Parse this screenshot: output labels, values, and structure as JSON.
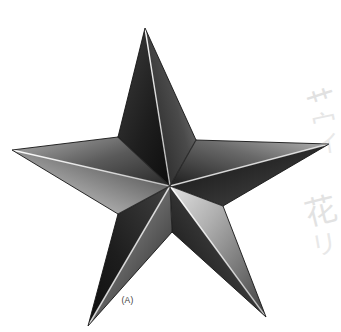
{
  "figure": {
    "caption": "(A)",
    "background_color": "#ffffff",
    "center": {
      "x": 170,
      "y": 186
    },
    "outer_points": [
      {
        "name": "top",
        "x": 145,
        "y": 28
      },
      {
        "name": "right",
        "x": 329,
        "y": 144
      },
      {
        "name": "bottom-right",
        "x": 266,
        "y": 317
      },
      {
        "name": "bottom-left",
        "x": 88,
        "y": 326
      },
      {
        "name": "left",
        "x": 12,
        "y": 150
      }
    ],
    "inner_points": [
      {
        "name": "upper-right",
        "x": 196,
        "y": 140
      },
      {
        "name": "lower-right",
        "x": 223,
        "y": 206
      },
      {
        "name": "lower",
        "x": 172,
        "y": 232
      },
      {
        "name": "lower-left",
        "x": 118,
        "y": 214
      },
      {
        "name": "upper-left",
        "x": 118,
        "y": 137
      }
    ],
    "palette": {
      "darkest": "#1a1a1a",
      "dark": "#3b3b3b",
      "mid_dark": "#5e5e5e",
      "mid": "#8a8a8a",
      "light": "#c9c9c9",
      "lightest": "#f2f2f2",
      "ridge_highlight": "#ffffff",
      "outline": "#262626",
      "caption_color": "#3a3a3a",
      "marginalia_color": "#b9b9b9"
    },
    "facets": [
      {
        "point": "top",
        "side": "left",
        "shade_from": "#2b2b2b",
        "shade_to": "#101010"
      },
      {
        "point": "top",
        "side": "right",
        "shade_from": "#6f6f6f",
        "shade_to": "#1f1f1f"
      },
      {
        "point": "right",
        "side": "left",
        "shade_from": "#9a9a9a",
        "shade_to": "#2a2a2a"
      },
      {
        "point": "right",
        "side": "right",
        "shade_from": "#3a3a3a",
        "shade_to": "#151515"
      },
      {
        "point": "bottom-right",
        "side": "left",
        "shade_from": "#cfcfcf",
        "shade_to": "#4a4a4a"
      },
      {
        "point": "bottom-right",
        "side": "right",
        "shade_from": "#4f4f4f",
        "shade_to": "#141414"
      },
      {
        "point": "bottom-left",
        "side": "left",
        "shade_from": "#2e2e2e",
        "shade_to": "#121212"
      },
      {
        "point": "bottom-left",
        "side": "right",
        "shade_from": "#9c9c9c",
        "shade_to": "#232323"
      },
      {
        "point": "left",
        "side": "left",
        "shade_from": "#8f8f8f",
        "shade_to": "#2d2d2d"
      },
      {
        "point": "left",
        "side": "right",
        "shade_from": "#d8d8d8",
        "shade_to": "#3f3f3f"
      }
    ]
  },
  "marginalia": {
    "description": "faint handwritten marks bleeding through from reverse of page",
    "marks": [
      {
        "glyph": "艹",
        "x": 308,
        "y": 88,
        "size": 30,
        "rotate": -18,
        "opacity": 0.42
      },
      {
        "glyph": "宀",
        "x": 312,
        "y": 112,
        "size": 26,
        "rotate": -12,
        "opacity": 0.34
      },
      {
        "glyph": "イ",
        "x": 316,
        "y": 130,
        "size": 24,
        "rotate": -8,
        "opacity": 0.3
      },
      {
        "glyph": "花",
        "x": 306,
        "y": 196,
        "size": 32,
        "rotate": -14,
        "opacity": 0.4
      },
      {
        "glyph": "リ",
        "x": 312,
        "y": 232,
        "size": 26,
        "rotate": -10,
        "opacity": 0.32
      }
    ]
  }
}
